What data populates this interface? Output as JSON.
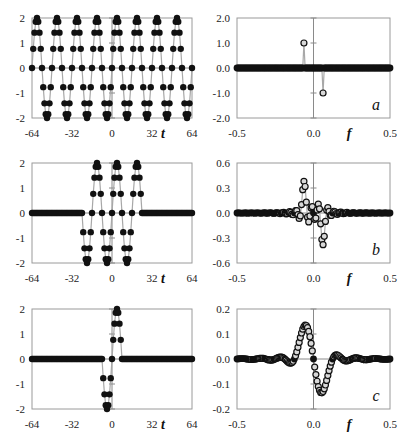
{
  "chart_data": [
    {
      "id": "a-time",
      "type": "scatter",
      "title": "",
      "xlabel": "t",
      "ylabel": "",
      "xlim": [
        -64,
        64
      ],
      "ylim": [
        -2,
        2
      ],
      "xticks": [
        "-64",
        "-32",
        "0",
        "32",
        "64"
      ],
      "yticks": [
        "2",
        "1",
        "0",
        "-1",
        "-2"
      ],
      "grid": false,
      "marker": "filled-circle",
      "description": "Sinusoid amplitude 2, period 16 samples, sampled at integer t from -64 to 64",
      "signal": {
        "kind": "sine",
        "amplitude": 2,
        "period": 16,
        "from": -64,
        "to": 64
      }
    },
    {
      "id": "a-freq",
      "type": "scatter",
      "panel_label": "a",
      "xlabel": "f",
      "ylabel": "",
      "xlim": [
        -0.5,
        0.5
      ],
      "ylim": [
        -2.0,
        2.0
      ],
      "xticks": [
        "-0.5",
        "0.0",
        "0.5"
      ],
      "yticks": [
        "2.0",
        "1.0",
        "0.0",
        "-1.0",
        "-2.0"
      ],
      "grid": false,
      "marker": "open-circle",
      "description": "Spectrum: two spikes at f = -0.0625 (+1.0) and f = +0.0625 (-1.0), zero elsewhere",
      "spikes": [
        {
          "f": -0.0625,
          "value": 1.0
        },
        {
          "f": 0.0625,
          "value": -1.0
        }
      ]
    },
    {
      "id": "b-time",
      "type": "scatter",
      "xlabel": "t",
      "ylabel": "",
      "xlim": [
        -64,
        64
      ],
      "ylim": [
        -2,
        2
      ],
      "xticks": [
        "-64",
        "-32",
        "0",
        "32",
        "64"
      ],
      "yticks": [
        "2",
        "1",
        "0",
        "-1",
        "-2"
      ],
      "grid": false,
      "marker": "filled-circle",
      "description": "Same sinusoid windowed to t in [-24, 24], zero elsewhere",
      "signal": {
        "kind": "sine",
        "amplitude": 2,
        "period": 16,
        "from": -64,
        "to": 64,
        "window": [
          -24,
          24
        ]
      }
    },
    {
      "id": "b-freq",
      "type": "scatter",
      "panel_label": "b",
      "xlabel": "f",
      "ylabel": "",
      "xlim": [
        -0.5,
        0.5
      ],
      "ylim": [
        -0.6,
        0.6
      ],
      "xticks": [
        "-0.5",
        "0.0",
        "0.5"
      ],
      "yticks": [
        "0.6",
        "0.3",
        "0.0",
        "-0.3",
        "-0.6"
      ],
      "grid": false,
      "marker": "open-circle",
      "description": "Spectrum of windowed sinusoid: peaks ~+0.38 near f=-0.06 and ~-0.37 near f=+0.06 with sidelobes",
      "peak_pos": 0.38,
      "peak_neg": -0.37
    },
    {
      "id": "c-time",
      "type": "scatter",
      "xlabel": "t",
      "ylabel": "",
      "xlim": [
        -64,
        64
      ],
      "ylim": [
        -2,
        2
      ],
      "xticks": [
        "-64",
        "-32",
        "0",
        "32",
        "64"
      ],
      "yticks": [
        "2",
        "1",
        "0",
        "-1",
        "-2"
      ],
      "grid": false,
      "marker": "filled-circle",
      "description": "Single period of sinusoid from t=-8 to t=8, zero elsewhere",
      "signal": {
        "kind": "sine",
        "amplitude": 2,
        "period": 16,
        "from": -64,
        "to": 64,
        "window": [
          -8,
          8
        ]
      }
    },
    {
      "id": "c-freq",
      "type": "scatter",
      "panel_label": "c",
      "xlabel": "f",
      "ylabel": "",
      "xlim": [
        -0.5,
        0.5
      ],
      "ylim": [
        -0.2,
        0.2
      ],
      "xticks": [
        "-0.5",
        "0.0",
        "0.5"
      ],
      "yticks": [
        "0.2",
        "0.1",
        "0.0",
        "-0.1",
        "-0.2"
      ],
      "grid": false,
      "marker": "open-circle",
      "description": "Spectrum of single period: smooth lobe peak ~+0.13 near f=-0.06, trough ~-0.13 near f=+0.06, small ripples",
      "peak_pos": 0.13,
      "peak_neg": -0.13
    }
  ],
  "labels": {
    "panel_a": "a",
    "panel_b": "b",
    "panel_c": "c",
    "t_axis": "t",
    "f_axis": "f"
  }
}
